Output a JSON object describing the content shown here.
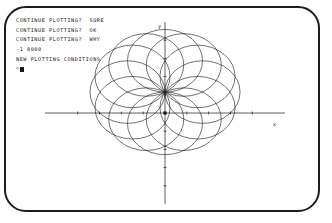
{
  "terminal": {
    "frame_color": "#1c1c1c",
    "background": "#ffffff",
    "text_color": "#1a1a1a",
    "lines": [
      "CONTINUE PLOTTING?  SURE",
      "CONTINUE PLOTTING?  OK",
      "CONTINUE PLOTTING?  WHY",
      "-1 8000",
      "NEW PLOTTING CONDITIONS"
    ],
    "prompt": {
      "caret": "^",
      "cursor": "block-cursor"
    }
  },
  "chart_data": {
    "type": "line",
    "title": "",
    "xlabel": "x",
    "ylabel": "y",
    "grid": false,
    "legend": false,
    "axis": {
      "x_axis_label": "x",
      "y_axis_label": "y",
      "origin": [
        0,
        0
      ],
      "xlim": [
        -5.5,
        5.5
      ],
      "ylim": [
        -5.0,
        5.0
      ],
      "x_ticks": [
        -4,
        -3,
        -2,
        -1,
        0,
        1,
        2,
        3,
        4
      ],
      "y_ticks": [
        -4,
        -3,
        -2,
        -1,
        0,
        1,
        2,
        3,
        4
      ],
      "tick_length": 3,
      "stroke": "#1a1a1a"
    },
    "common_point": [
      0,
      1.15
    ],
    "circle_radius": 1.72,
    "series": [
      {
        "name": "circle-1",
        "angle_deg": 0,
        "center": [
          0.0,
          -0.57
        ]
      },
      {
        "name": "circle-2",
        "angle_deg": 30,
        "center": [
          0.86,
          -0.34
        ]
      },
      {
        "name": "circle-3",
        "angle_deg": 60,
        "center": [
          1.49,
          0.29
        ]
      },
      {
        "name": "circle-4",
        "angle_deg": 90,
        "center": [
          1.72,
          1.15
        ]
      },
      {
        "name": "circle-5",
        "angle_deg": 120,
        "center": [
          1.49,
          2.01
        ]
      },
      {
        "name": "circle-6",
        "angle_deg": 150,
        "center": [
          0.86,
          2.64
        ]
      },
      {
        "name": "circle-7",
        "angle_deg": 180,
        "center": [
          0.0,
          2.87
        ]
      },
      {
        "name": "circle-8",
        "angle_deg": 210,
        "center": [
          -0.86,
          2.64
        ]
      },
      {
        "name": "circle-9",
        "angle_deg": 240,
        "center": [
          -1.49,
          2.01
        ]
      },
      {
        "name": "circle-10",
        "angle_deg": 270,
        "center": [
          -1.72,
          1.15
        ]
      },
      {
        "name": "circle-11",
        "angle_deg": 300,
        "center": [
          -1.49,
          0.29
        ]
      },
      {
        "name": "circle-12",
        "angle_deg": 330,
        "center": [
          -0.86,
          -0.34
        ]
      }
    ]
  }
}
